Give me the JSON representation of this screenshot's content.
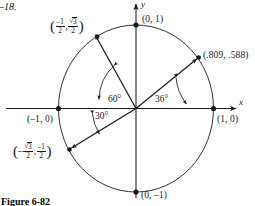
{
  "figure": {
    "exercise_note": "–18.",
    "caption": "Figure 6-82",
    "axes": {
      "x_label": "x",
      "y_label": "y"
    },
    "unit_circle_points": [
      {
        "name": "top",
        "label": "(0, 1)",
        "angle_deg": 90
      },
      {
        "name": "right",
        "label": "(1, 0)",
        "angle_deg": 0
      },
      {
        "name": "left",
        "label": "(–1, 0)",
        "angle_deg": 180
      },
      {
        "name": "bottom",
        "label": "(0, –1)",
        "angle_deg": 270
      }
    ],
    "terminal_points": [
      {
        "name": "point-120-deg",
        "angle_deg": 120,
        "x_numerator": "–1",
        "x_denominator": "2",
        "y_numerator": "3",
        "y_denominator": "2",
        "y_has_radical": true
      },
      {
        "name": "point-36-deg",
        "angle_deg": 36,
        "label": "(.809, .588)"
      },
      {
        "name": "point-210-deg",
        "angle_deg": 210,
        "x_numerator": "3",
        "x_denominator": "2",
        "x_has_radical": true,
        "x_sign": "–",
        "y_numerator": "–1",
        "y_denominator": "2"
      }
    ],
    "angle_arcs": [
      {
        "name": "angle-60",
        "label": "60°"
      },
      {
        "name": "angle-36",
        "label": "36°"
      },
      {
        "name": "angle-30",
        "label": "30°"
      }
    ],
    "colors": {
      "stroke": "#1a1a1a",
      "background": "#ffffff"
    }
  }
}
